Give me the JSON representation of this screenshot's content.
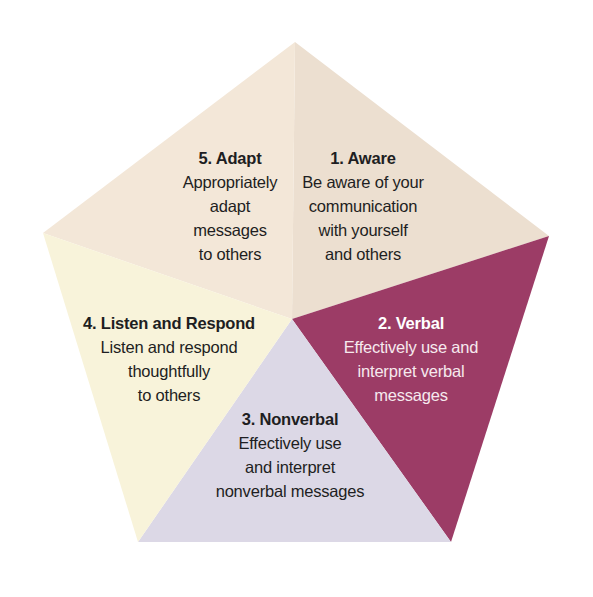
{
  "diagram": {
    "type": "pentagon-segments",
    "center": [
      292,
      319
    ],
    "vertices": {
      "top": [
        295,
        42
      ],
      "right": [
        549,
        236
      ],
      "bottom_right": [
        451,
        542
      ],
      "bottom_left": [
        138,
        542
      ],
      "left": [
        43,
        233
      ]
    },
    "segments": [
      {
        "id": "aware",
        "title": "1. Aware",
        "lines": [
          "Be aware of your",
          "communication",
          "with yourself",
          "and others"
        ],
        "color": "#ecdfd0",
        "text_color": "#1e1e22"
      },
      {
        "id": "verbal",
        "title": "2. Verbal",
        "lines": [
          "Effectively use and",
          "interpret verbal",
          "messages"
        ],
        "color": "#9c3c66",
        "text_color": "#f6e9ee"
      },
      {
        "id": "nonverbal",
        "title": "3. Nonverbal",
        "lines": [
          "Effectively use",
          "and interpret",
          "nonverbal messages"
        ],
        "color": "#dcd8e6",
        "text_color": "#1e1e22"
      },
      {
        "id": "listen",
        "title": "4. Listen and Respond",
        "lines": [
          "Listen and respond",
          "thoughtfully",
          "to others"
        ],
        "color": "#f8f3da",
        "text_color": "#1e1e22"
      },
      {
        "id": "adapt",
        "title": "5. Adapt",
        "lines": [
          "Appropriately",
          "adapt",
          "messages",
          "to others"
        ],
        "color": "#f3e6d6",
        "text_color": "#1e1e22"
      }
    ]
  }
}
